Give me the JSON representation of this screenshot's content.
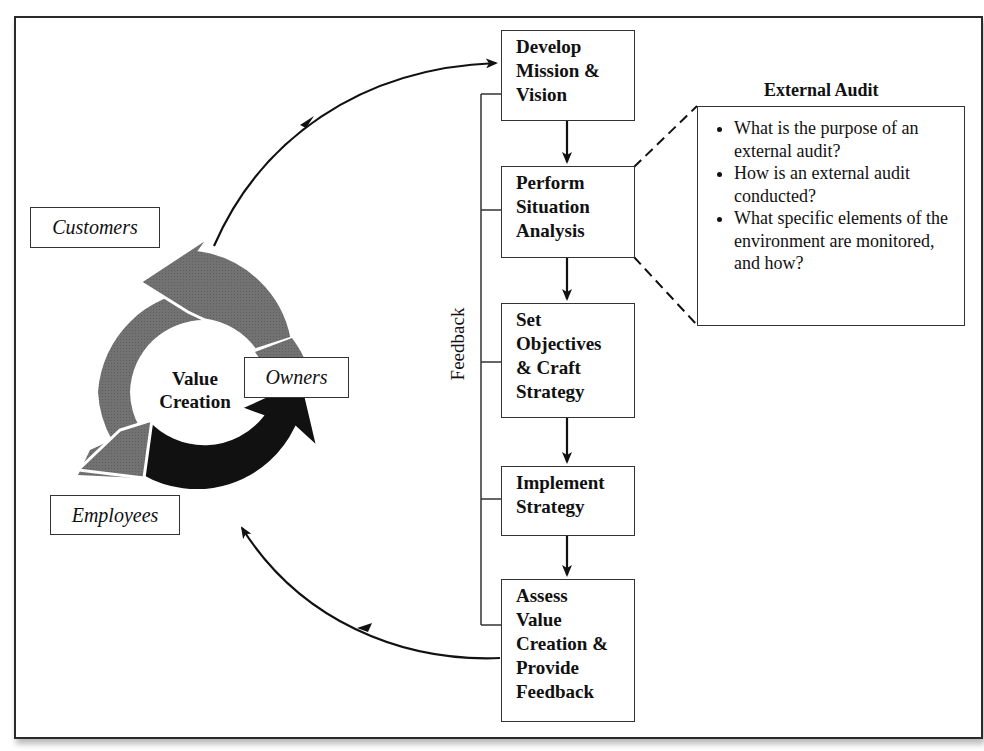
{
  "diagram": {
    "cycle": {
      "center_label": [
        "Value",
        "Creation"
      ],
      "stakeholders": [
        {
          "id": "customers",
          "label": "Customers"
        },
        {
          "id": "owners",
          "label": "Owners"
        },
        {
          "id": "employees",
          "label": "Employees"
        }
      ],
      "colors": {
        "customers_arrow": "#6e6e6e",
        "employees_arrow": "#7a7a7a",
        "owners_arrow": "#111111"
      }
    },
    "process_steps": [
      {
        "id": "develop",
        "lines": [
          "Develop",
          "Mission &",
          "Vision"
        ]
      },
      {
        "id": "perform",
        "lines": [
          "Perform",
          "Situation",
          "Analysis"
        ]
      },
      {
        "id": "objectives",
        "lines": [
          "Set",
          "Objectives",
          "& Craft",
          "Strategy"
        ]
      },
      {
        "id": "implement",
        "lines": [
          "Implement",
          "Strategy"
        ]
      },
      {
        "id": "assess",
        "lines": [
          "Assess",
          "Value",
          "Creation &",
          "Provide",
          "Feedback"
        ]
      }
    ],
    "feedback_label": "Feedback",
    "external_audit": {
      "title": "External Audit",
      "bullets": [
        "What is the purpose of an external audit?",
        "How is an external audit conducted?",
        "What specific elements of the environment are monitored, and how?"
      ]
    }
  }
}
